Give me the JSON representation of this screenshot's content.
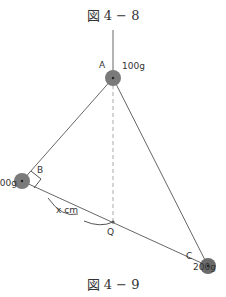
{
  "figure_top_caption": "図 4 − 8",
  "figure_bottom_caption": "図 4 − 9",
  "masses": {
    "A": {
      "label": "A",
      "mass": "100g"
    },
    "B": {
      "label": "B",
      "mass": "200g"
    },
    "C": {
      "label": "C",
      "mass": "200g"
    }
  },
  "point_q": "Q",
  "distance_label": "x cm",
  "colors": {
    "ball": "#7a7a7a",
    "line": "#666666",
    "dashed": "#999999"
  }
}
